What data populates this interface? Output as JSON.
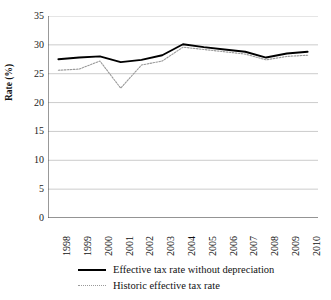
{
  "figure": {
    "title_remnant": "",
    "background": "#ffffff"
  },
  "chart_data": {
    "type": "line",
    "title": "",
    "xlabel": "",
    "ylabel": "Rate (%)",
    "ylim": [
      0,
      35
    ],
    "yticks": [
      35,
      30,
      25,
      20,
      15,
      10,
      5,
      0
    ],
    "grid": "horizontal",
    "legend_position": "bottom",
    "categories": [
      "1998",
      "1999",
      "2000",
      "2001",
      "2002",
      "2003",
      "2004",
      "2005",
      "2006",
      "2007",
      "2008",
      "2009",
      "2010"
    ],
    "series": [
      {
        "name": "Effective tax rate without depreciation",
        "style": "solid",
        "color": "#000000",
        "values": [
          27.5,
          27.8,
          28.0,
          27.0,
          27.4,
          28.2,
          30.1,
          29.6,
          29.2,
          28.8,
          27.8,
          28.5,
          28.8
        ]
      },
      {
        "name": "Historic effective tax rate",
        "style": "dotted",
        "color": "#9a9a9a",
        "values": [
          25.6,
          25.8,
          27.2,
          22.5,
          26.5,
          27.2,
          29.6,
          29.2,
          28.8,
          28.4,
          27.4,
          28.0,
          28.2
        ]
      }
    ]
  },
  "axis": {
    "y_label": "Rate (%)",
    "y_ticks": [
      "35",
      "30",
      "25",
      "20",
      "15",
      "10",
      "5",
      "0"
    ],
    "x_ticks": [
      "1998",
      "1999",
      "2000",
      "2001",
      "2002",
      "2003",
      "2004",
      "2005",
      "2006",
      "2007",
      "2008",
      "2009",
      "2010"
    ]
  },
  "legend": {
    "items": [
      {
        "label": "Effective tax rate without depreciation",
        "style": "solid"
      },
      {
        "label": "Historic effective tax rate",
        "style": "dotted"
      }
    ]
  },
  "colors": {
    "series_primary": "#000000",
    "series_secondary": "#9a9a9a",
    "gridline": "#b5b5b5",
    "axis": "#444444"
  }
}
